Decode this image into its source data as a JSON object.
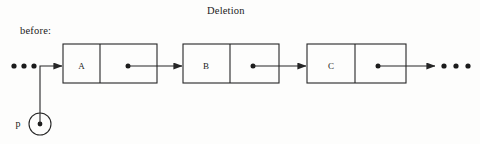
{
  "figure": {
    "title": "Deletion",
    "stage_label": "before:",
    "background_color": "#fdfdfc",
    "stroke_color": "#262626",
    "text_color": "#1b1b1b"
  },
  "diagram": {
    "type": "linked-list",
    "nodes": [
      {
        "label": "A",
        "x": 63,
        "y": 44,
        "width": 94,
        "height": 39,
        "divider_x": 100,
        "pointer_dot_x": 128,
        "pointer_dot_y": 66
      },
      {
        "label": "B",
        "x": 183,
        "y": 44,
        "width": 96,
        "height": 39,
        "divider_x": 230,
        "pointer_dot_x": 253,
        "pointer_dot_y": 66
      },
      {
        "label": "C",
        "x": 307,
        "y": 44,
        "width": 99,
        "height": 39,
        "divider_x": 355,
        "pointer_dot_x": 378,
        "pointer_dot_y": 66
      }
    ],
    "links": [
      {
        "from": "A",
        "to": "B",
        "x1": 128,
        "x2": 183,
        "y": 66
      },
      {
        "from": "B",
        "to": "C",
        "x1": 253,
        "x2": 307,
        "y": 66
      },
      {
        "from": "C",
        "to": "ellipsis-right",
        "x1": 378,
        "x2": 436,
        "y": 66
      }
    ],
    "ellipsis_left": {
      "cx": [
        14,
        24,
        34
      ],
      "cy": 66,
      "r": 2.6,
      "count": 3
    },
    "ellipsis_right": {
      "cx": [
        444,
        456,
        468
      ],
      "cy": 66,
      "r": 2.6,
      "count": 3
    },
    "pointer_variable": {
      "label": "p",
      "label_x": 18,
      "label_y": 127,
      "circle_cx": 40,
      "circle_cy": 124,
      "circle_r": 11,
      "dot_r": 2.4,
      "target_node": "A",
      "elbow_up_to_y": 66,
      "arrow_tip_x": 63
    }
  }
}
